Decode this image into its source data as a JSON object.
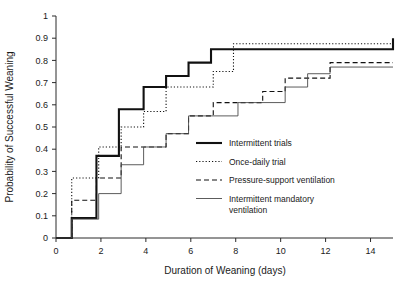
{
  "chart_data": {
    "type": "line",
    "title": "",
    "xlabel": "Duration of Weaning (days)",
    "ylabel": "Probability of Successful Weaning",
    "xlim": [
      0,
      15
    ],
    "ylim": [
      0,
      1
    ],
    "grid": false,
    "legend_position": "center-right",
    "xticks": [
      0,
      2,
      4,
      6,
      8,
      10,
      12,
      14
    ],
    "xticklabels": [
      "0",
      "2",
      "4",
      "6",
      "8",
      "10",
      "12",
      "14"
    ],
    "yticks": [
      0,
      0.1,
      0.2,
      0.3,
      0.4,
      0.5,
      0.6,
      0.7,
      0.8,
      0.9,
      1
    ],
    "yticklabels": [
      "0",
      "0.1",
      "0.2",
      "0.3",
      "0.4",
      "0.5",
      "0.6",
      "0.7",
      "0.8",
      "0.9",
      "1"
    ],
    "step_style": "post",
    "series": [
      {
        "name": "Intermittent trials",
        "style": "solid-thick",
        "x": [
          0,
          0.7,
          1.8,
          2.8,
          3.9,
          4.9,
          5.9,
          6.9,
          15
        ],
        "y": [
          0,
          0.09,
          0.37,
          0.58,
          0.68,
          0.73,
          0.79,
          0.85,
          0.9
        ]
      },
      {
        "name": "Once-daily trial",
        "style": "dotted",
        "x": [
          0,
          0.7,
          1.9,
          2.9,
          3.9,
          4.9,
          6.1,
          7.0,
          7.9,
          15
        ],
        "y": [
          0,
          0.27,
          0.41,
          0.5,
          0.57,
          0.68,
          0.68,
          0.75,
          0.875,
          0.875
        ]
      },
      {
        "name": "Pressure-support ventilation",
        "style": "dashed",
        "x": [
          0,
          0.7,
          1.8,
          2.9,
          3.9,
          4.9,
          5.9,
          7.0,
          8.0,
          9.2,
          10.2,
          11.2,
          12.2,
          15
        ],
        "y": [
          0,
          0.17,
          0.27,
          0.41,
          0.41,
          0.47,
          0.55,
          0.61,
          0.61,
          0.66,
          0.72,
          0.72,
          0.79,
          0.79
        ]
      },
      {
        "name": "Intermittent mandatory ventilation",
        "style": "solid-thin",
        "x": [
          0,
          0.7,
          1.9,
          2.9,
          3.9,
          4.9,
          5.9,
          7.0,
          8.1,
          9.1,
          10.2,
          11.2,
          12.2,
          15
        ],
        "y": [
          0,
          0.085,
          0.2,
          0.33,
          0.41,
          0.47,
          0.55,
          0.55,
          0.61,
          0.61,
          0.68,
          0.74,
          0.77,
          0.77
        ]
      }
    ]
  },
  "legend": {
    "items": [
      {
        "label": "Intermittent  trials",
        "label2": "",
        "style": "solid-thick"
      },
      {
        "label": "Once-daily  trial",
        "label2": "",
        "style": "dotted"
      },
      {
        "label": "Pressure-support  ventilation",
        "label2": "",
        "style": "dashed"
      },
      {
        "label": "Intermittent  mandatory",
        "label2": "ventilation",
        "style": "solid-thin"
      }
    ]
  }
}
